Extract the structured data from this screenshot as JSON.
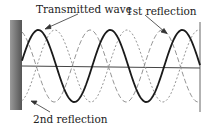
{
  "diagram": {
    "labels": {
      "transmitted": "Transmitted wave",
      "first_reflection": "1st reflection",
      "second_reflection": "2nd reflection"
    },
    "colors": {
      "wall": "#6e6e6e",
      "solid_wave": "#1a1a1a",
      "dashed_wave": "#777777",
      "axis": "#444444"
    },
    "geometry": {
      "wall_x": 22,
      "right_boundary_x": 200,
      "axis_y": 66,
      "amplitude": 36,
      "wavelength": 72
    }
  }
}
